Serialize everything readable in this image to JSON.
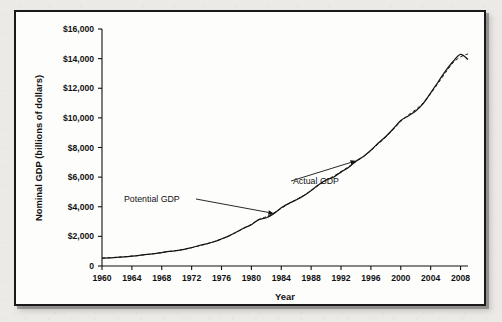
{
  "figure": {
    "background_color": "#eceae6",
    "panel_color": "#fdfdfc",
    "border_color": "#1a1a1a"
  },
  "chart_data": {
    "type": "line",
    "title": "",
    "xlabel": "Year",
    "ylabel": "Nominal GDP (billions of dollars)",
    "xlim": [
      1960,
      2009
    ],
    "ylim": [
      0,
      16000
    ],
    "grid": false,
    "legend_position": "annotations-inline",
    "x_tick_labels": [
      "1960",
      "1964",
      "1968",
      "1972",
      "1976",
      "1980",
      "1984",
      "1988",
      "1992",
      "1996",
      "2000",
      "2004",
      "2008"
    ],
    "x_ticks": [
      1960,
      1964,
      1968,
      1972,
      1976,
      1980,
      1984,
      1988,
      1992,
      1996,
      2000,
      2004,
      2008
    ],
    "y_tick_labels": [
      "0",
      "$2,000",
      "$4,000",
      "$6,000",
      "$8,000",
      "$10,000",
      "$12,000",
      "$14,000",
      "$16,000"
    ],
    "y_ticks": [
      0,
      2000,
      4000,
      6000,
      8000,
      10000,
      12000,
      14000,
      16000
    ],
    "x": [
      1960,
      1961,
      1962,
      1963,
      1964,
      1965,
      1966,
      1967,
      1968,
      1969,
      1970,
      1971,
      1972,
      1973,
      1974,
      1975,
      1976,
      1977,
      1978,
      1979,
      1980,
      1981,
      1982,
      1983,
      1984,
      1985,
      1986,
      1987,
      1988,
      1989,
      1990,
      1991,
      1992,
      1993,
      1994,
      1995,
      1996,
      1997,
      1998,
      1999,
      2000,
      2001,
      2002,
      2003,
      2004,
      2005,
      2006,
      2007,
      2008,
      2009
    ],
    "series": [
      {
        "name": "Actual GDP",
        "style": "solid",
        "values": [
          526,
          545,
          586,
          618,
          664,
          719,
          788,
          833,
          910,
          985,
          1039,
          1128,
          1240,
          1385,
          1501,
          1638,
          1825,
          2031,
          2294,
          2563,
          2790,
          3128,
          3255,
          3537,
          3933,
          4220,
          4463,
          4740,
          5104,
          5484,
          5803,
          5996,
          6338,
          6657,
          7072,
          7398,
          7817,
          8304,
          8747,
          9268,
          9817,
          10128,
          10470,
          10961,
          11686,
          12422,
          13178,
          13808,
          14291,
          13939
        ]
      },
      {
        "name": "Potential GDP",
        "style": "dashed",
        "values": [
          535,
          556,
          592,
          625,
          668,
          715,
          775,
          835,
          905,
          980,
          1050,
          1135,
          1235,
          1360,
          1495,
          1650,
          1830,
          2035,
          2280,
          2545,
          2820,
          3135,
          3330,
          3580,
          3890,
          4205,
          4480,
          4760,
          5090,
          5450,
          5790,
          6060,
          6380,
          6690,
          7050,
          7390,
          7790,
          8250,
          8700,
          9220,
          9760,
          10190,
          10560,
          11020,
          11640,
          12340,
          13060,
          13720,
          14120,
          14320
        ]
      }
    ],
    "annotations": [
      {
        "label": "Potential GDP",
        "points_to_year": 1983,
        "points_to_value": 3550
      },
      {
        "label": "Actual GDP",
        "points_to_year": 1994,
        "points_to_value": 7100
      }
    ]
  }
}
